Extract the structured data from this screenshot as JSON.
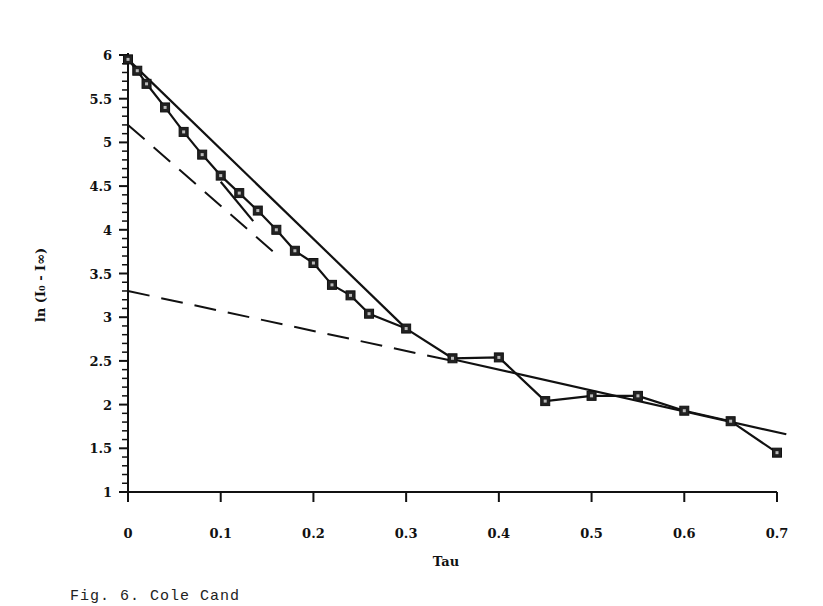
{
  "chart_data": {
    "type": "line",
    "title": "",
    "xlabel": "Tau",
    "ylabel": "ln (I₀ - I∞)",
    "xlim": [
      0,
      0.7
    ],
    "ylim": [
      1,
      6
    ],
    "x_ticks": [
      "0",
      "0.1",
      "0.2",
      "0.3",
      "0.4",
      "0.5",
      "0.6",
      "0.7"
    ],
    "y_ticks": [
      "1",
      "1.5",
      "2",
      "2.5",
      "3",
      "3.5",
      "4",
      "4.5",
      "5",
      "5.5",
      "6"
    ],
    "grid": false,
    "legend": null,
    "series": [
      {
        "name": "data",
        "style": "solid-with-square-markers",
        "x": [
          0,
          0.01,
          0.02,
          0.04,
          0.06,
          0.08,
          0.1,
          0.12,
          0.14,
          0.16,
          0.18,
          0.2,
          0.22,
          0.24,
          0.26,
          0.3,
          0.35,
          0.4,
          0.45,
          0.5,
          0.55,
          0.6,
          0.65,
          0.7
        ],
        "y": [
          5.95,
          5.82,
          5.67,
          5.4,
          5.12,
          4.86,
          4.62,
          4.42,
          4.22,
          4.0,
          3.76,
          3.62,
          3.37,
          3.25,
          3.04,
          2.87,
          2.53,
          2.54,
          2.04,
          2.1,
          2.1,
          1.93,
          1.81,
          1.45
        ]
      },
      {
        "name": "fit-fast",
        "style": "solid",
        "x": [
          0,
          0.3
        ],
        "y": [
          5.95,
          2.87
        ]
      },
      {
        "name": "fit-slow",
        "style": "solid",
        "x": [
          0.35,
          0.71
        ],
        "y": [
          2.52,
          1.66
        ]
      },
      {
        "name": "fit-short",
        "style": "solid",
        "x": [
          0.1,
          0.135
        ],
        "y": [
          4.55,
          4.1
        ]
      },
      {
        "name": "extrapolation-fast",
        "style": "dashed",
        "x": [
          0,
          0.16
        ],
        "y": [
          5.2,
          3.72
        ]
      },
      {
        "name": "extrapolation-slow",
        "style": "dashed",
        "x": [
          0,
          0.35
        ],
        "y": [
          3.3,
          2.5
        ]
      }
    ]
  },
  "caption": "Fig. 6.  Cole Cand"
}
